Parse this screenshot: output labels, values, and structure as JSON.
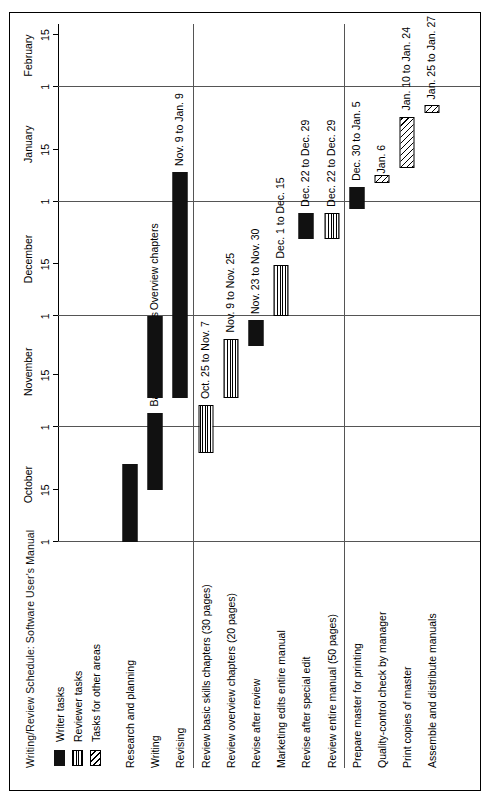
{
  "chart_title": "Writing/Review Schedule: Software User's Manual",
  "legend": {
    "items": [
      {
        "label": "Writer tasks",
        "pattern": "solid"
      },
      {
        "label": "Reviewer tasks",
        "pattern": "horizontal-lines"
      },
      {
        "label": "Tasks for other areas",
        "pattern": "diagonal-hatch"
      }
    ]
  },
  "axis": {
    "months": [
      "October",
      "November",
      "December",
      "January",
      "February"
    ],
    "day_ticks": [
      "1",
      "15",
      "1",
      "15",
      "1",
      "15",
      "1",
      "15",
      "1",
      "15"
    ]
  },
  "chart_data": {
    "type": "bar",
    "title": "Writing/Review Schedule: Software User's Manual",
    "xlabel": "",
    "ylabel": "",
    "orientation": "horizontal-gantt",
    "xlim": [
      "Oct 1",
      "Feb 18"
    ],
    "grid": true,
    "legend_position": "top-left",
    "categories": [
      "Research and planning",
      "Writing",
      "Revising",
      "Review basic skills chapters (30 pages)",
      "Review overview chapters (20 pages)",
      "Revise after review",
      "Marketing edits entire manual",
      "Revise after special edit",
      "Review entire manual (50 pages)",
      "Prepare master for printing",
      "Quality-control check by manager",
      "Print copies of master",
      "Assemble and distribute manuals"
    ],
    "groups": [
      {
        "name": "writing-group",
        "rows": [
          0,
          1,
          2
        ]
      },
      {
        "name": "review-group",
        "rows": [
          3,
          4,
          5,
          6,
          7,
          8
        ]
      },
      {
        "name": "production-group",
        "rows": [
          9,
          10,
          11,
          12
        ]
      }
    ],
    "bars": [
      {
        "task": "Research and planning",
        "row": 0,
        "pattern": "solid",
        "start": "Oct. 1",
        "end": "Oct. 22",
        "note": ""
      },
      {
        "task": "Writing",
        "row": 1,
        "pattern": "solid",
        "start": "Oct. 15",
        "end": "Nov. 5",
        "note": "Basic skills chapters"
      },
      {
        "task": "Writing",
        "row": 1,
        "pattern": "solid",
        "start": "Nov. 9",
        "end": "Dec. 1",
        "note": "Overview chapters"
      },
      {
        "task": "Revising",
        "row": 2,
        "pattern": "solid",
        "start": "Nov. 9",
        "end": "Jan. 9",
        "note": "Nov. 9 to Jan. 9"
      },
      {
        "task": "Review basic skills chapters (30 pages)",
        "row": 3,
        "pattern": "horizontal-lines",
        "start": "Oct. 25",
        "end": "Nov. 7",
        "note": "Oct. 25 to Nov. 7"
      },
      {
        "task": "Review overview chapters (20 pages)",
        "row": 4,
        "pattern": "horizontal-lines",
        "start": "Nov. 9",
        "end": "Nov. 25",
        "note": "Nov. 9 to Nov. 25"
      },
      {
        "task": "Revise after review",
        "row": 5,
        "pattern": "solid",
        "start": "Nov. 23",
        "end": "Nov. 30",
        "note": "Nov. 23 to Nov. 30"
      },
      {
        "task": "Marketing edits entire manual",
        "row": 6,
        "pattern": "horizontal-lines",
        "start": "Dec. 1",
        "end": "Dec. 15",
        "note": "Dec. 1 to Dec. 15"
      },
      {
        "task": "Revise after special edit",
        "row": 7,
        "pattern": "solid",
        "start": "Dec. 22",
        "end": "Dec. 29",
        "note": "Dec. 22 to Dec. 29"
      },
      {
        "task": "Review entire manual (50 pages)",
        "row": 8,
        "pattern": "horizontal-lines",
        "start": "Dec. 22",
        "end": "Dec. 29",
        "note": "Dec. 22 to Dec. 29"
      },
      {
        "task": "Prepare master for printing",
        "row": 9,
        "pattern": "solid",
        "start": "Dec. 30",
        "end": "Jan. 5",
        "note": "Dec. 30 to Jan. 5"
      },
      {
        "task": "Quality-control check by manager",
        "row": 10,
        "pattern": "diagonal-hatch",
        "start": "Jan. 6",
        "end": "Jan. 7",
        "note": "Jan. 6"
      },
      {
        "task": "Print copies of master",
        "row": 11,
        "pattern": "diagonal-hatch",
        "start": "Jan. 10",
        "end": "Jan. 24",
        "note": "Jan. 10 to Jan. 24"
      },
      {
        "task": "Assemble and distribute manuals",
        "row": 12,
        "pattern": "diagonal-hatch",
        "start": "Jan. 25",
        "end": "Jan. 27",
        "note": "Jan. 25 to Jan. 27"
      }
    ]
  }
}
